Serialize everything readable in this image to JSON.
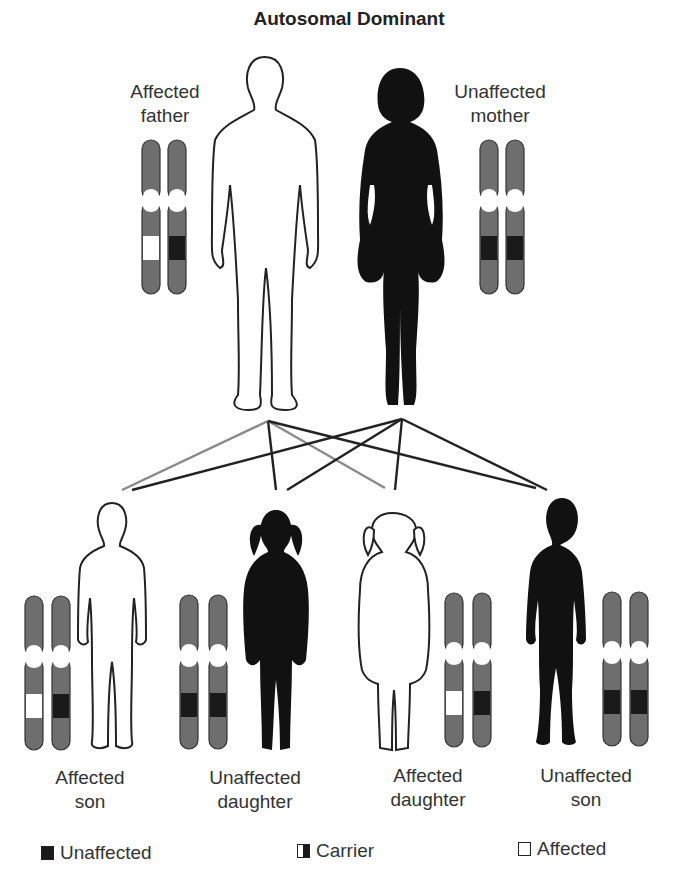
{
  "title": "Autosomal Dominant",
  "parents": {
    "father": {
      "line1": "Affected",
      "line2": "father",
      "status": "affected",
      "alleles": [
        "affected",
        "unaffected"
      ]
    },
    "mother": {
      "line1": "Unaffected",
      "line2": "mother",
      "status": "unaffected",
      "alleles": [
        "unaffected",
        "unaffected"
      ]
    }
  },
  "children": [
    {
      "line1": "Affected",
      "line2": "son",
      "status": "affected",
      "alleles": [
        "affected",
        "unaffected"
      ]
    },
    {
      "line1": "Unaffected",
      "line2": "daughter",
      "status": "unaffected",
      "alleles": [
        "unaffected",
        "unaffected"
      ]
    },
    {
      "line1": "Affected",
      "line2": "daughter",
      "status": "affected",
      "alleles": [
        "affected",
        "unaffected"
      ]
    },
    {
      "line1": "Unaffected",
      "line2": "son",
      "status": "unaffected",
      "alleles": [
        "unaffected",
        "unaffected"
      ]
    }
  ],
  "legend": [
    {
      "label": "Unaffected",
      "swatch": "filled"
    },
    {
      "label": "Carrier",
      "swatch": "half"
    },
    {
      "label": "Affected",
      "swatch": "empty"
    }
  ],
  "colors": {
    "chromosome": "#6e6e6e",
    "unaffected_band": "#1a1a1a",
    "affected_band": "#ffffff",
    "line_dark": "#222222",
    "line_gray": "#8a8a8a"
  }
}
